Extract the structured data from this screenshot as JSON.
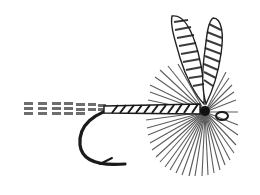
{
  "image": {
    "subject": "Dry fly fishing lure illustration",
    "style": "black-and-white engraving",
    "parts": [
      "tail",
      "body",
      "hook",
      "hackle",
      "wings",
      "eye"
    ],
    "colors": {
      "background": "#ffffff",
      "ink": "#1a1a1a",
      "mid_ink": "#555555"
    }
  }
}
